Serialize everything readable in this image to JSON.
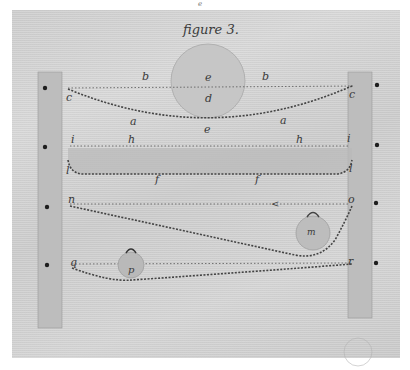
{
  "figure": {
    "title": "figure 3.",
    "top_mark": "e",
    "colors": {
      "paper": "#d2d2d2",
      "post": "#bdbdbd",
      "ink": "#3a3a3a",
      "ball": "#c4c4c4"
    },
    "posts": [
      {
        "side": "left",
        "x": 38,
        "top": 72,
        "bottom": 328
      },
      {
        "side": "right",
        "x": 360,
        "top": 72,
        "bottom": 318
      }
    ],
    "pegs": [
      {
        "x": 22,
        "y": 88
      },
      {
        "x": 22,
        "y": 147
      },
      {
        "x": 22,
        "y": 207
      },
      {
        "x": 22,
        "y": 265
      },
      {
        "x": 377,
        "y": 85
      },
      {
        "x": 377,
        "y": 145
      },
      {
        "x": 377,
        "y": 203
      },
      {
        "x": 377,
        "y": 263
      }
    ],
    "labels": {
      "b_left": "b",
      "b_right": "b",
      "c_left": "c",
      "c_right": "c",
      "e_ball_top": "e",
      "d_ball": "d",
      "e_bottom": "e",
      "a_left": "a",
      "a_right": "a",
      "i_left": "i",
      "i_right": "i",
      "h_left": "h",
      "h_right": "h",
      "l_left": "l",
      "l_right": "l",
      "f_left": "f",
      "f_right": "f",
      "n": "n",
      "o": "o",
      "arrow": "<",
      "m": "m",
      "p": "p",
      "q": "q",
      "r": "r"
    },
    "systems": [
      {
        "name": "upper rope with large ball",
        "points": "c-a-e-a-c",
        "reference_line": "b"
      },
      {
        "name": "board under tension",
        "points": "i-h-h-i",
        "rope": "l-f-f-l"
      },
      {
        "name": "slanted rope with hanging weight",
        "points": "n-o",
        "weight": "m"
      },
      {
        "name": "lower rope with small weight",
        "points": "q-r",
        "weight": "p"
      }
    ]
  }
}
